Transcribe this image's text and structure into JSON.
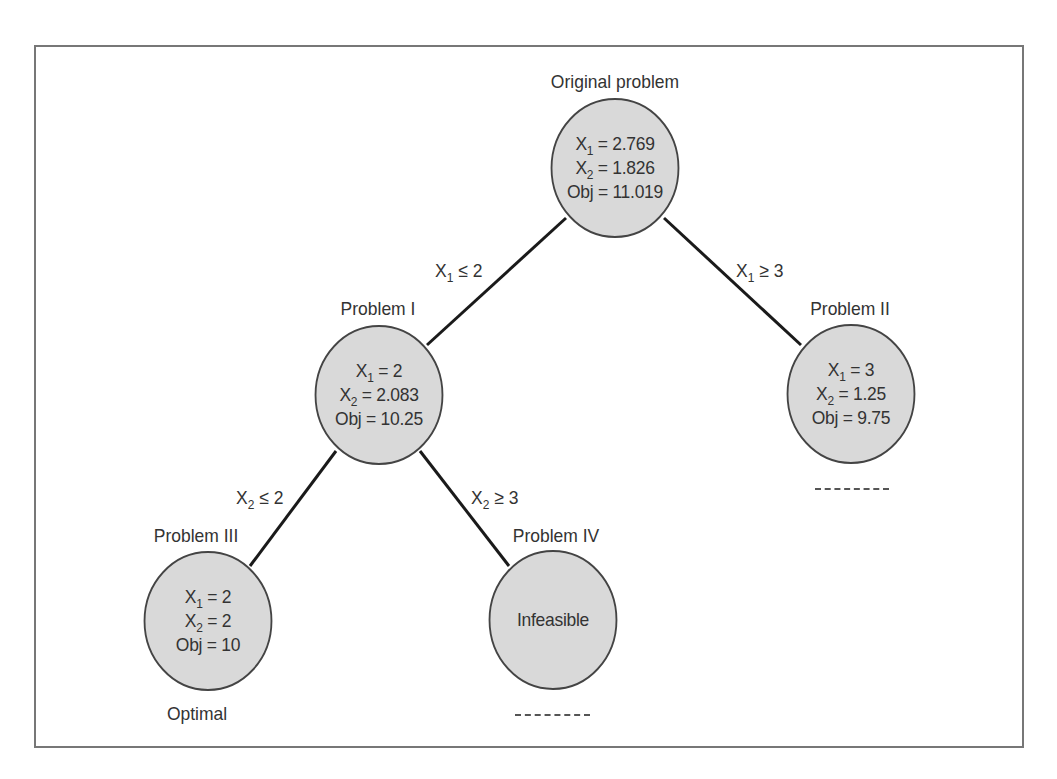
{
  "diagram": {
    "type": "branch-and-bound-tree",
    "colors": {
      "node_fill": "#d9d9d9",
      "node_stroke": "#444444",
      "edge": "#1a1a1a",
      "text": "#333333",
      "frame": "#777777"
    },
    "nodes": {
      "original": {
        "title": "Original problem",
        "x1_var": "X",
        "x1_sub": "1",
        "x1_val": " = 2.769",
        "x2_var": "X",
        "x2_sub": "2",
        "x2_val": " = 1.826",
        "obj": "Obj = 11.019"
      },
      "p1": {
        "title": "Problem I",
        "x1_var": "X",
        "x1_sub": "1",
        "x1_val": " = 2",
        "x2_var": "X",
        "x2_sub": "2",
        "x2_val": " = 2.083",
        "obj": "Obj = 10.25"
      },
      "p2": {
        "title": "Problem II",
        "x1_var": "X",
        "x1_sub": "1",
        "x1_val": " = 3",
        "x2_var": "X",
        "x2_sub": "2",
        "x2_val": " = 1.25",
        "obj": "Obj = 9.75",
        "status": "------"
      },
      "p3": {
        "title": "Problem III",
        "x1_var": "X",
        "x1_sub": "1",
        "x1_val": " = 2",
        "x2_var": "X",
        "x2_sub": "2",
        "x2_val": " = 2",
        "obj": "Obj = 10",
        "status": "Optimal"
      },
      "p4": {
        "title": "Problem IV",
        "body": "Infeasible",
        "status": "------"
      }
    },
    "branches": {
      "orig_p1": {
        "var": "X",
        "sub": "1",
        "rel": " ≤ 2"
      },
      "orig_p2": {
        "var": "X",
        "sub": "1",
        "rel": " ≥ 3"
      },
      "p1_p3": {
        "var": "X",
        "sub": "2",
        "rel": " ≤ 2"
      },
      "p1_p4": {
        "var": "X",
        "sub": "2",
        "rel": " ≥ 3"
      }
    }
  }
}
